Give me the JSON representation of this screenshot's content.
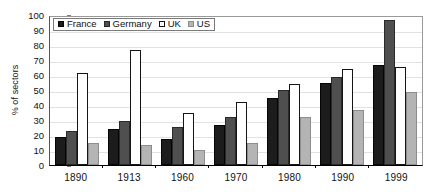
{
  "chart_data": {
    "type": "bar",
    "title": "",
    "subtitle": "",
    "xlabel": "",
    "ylabel": "% of sectors",
    "ylim": [
      0,
      100
    ],
    "ytick_step": 10,
    "yticks": [
      100,
      90,
      80,
      70,
      60,
      50,
      40,
      30,
      20,
      10,
      0
    ],
    "grid": true,
    "legend_position": "top-left",
    "categories": [
      "1890",
      "1913",
      "1960",
      "1970",
      "1980",
      "1990",
      "1999"
    ],
    "series": [
      {
        "name": "France",
        "color": "#1c1c1c",
        "values": [
          18.5,
          24,
          17.5,
          27,
          45,
          55,
          66.5
        ]
      },
      {
        "name": "Germany",
        "color": "#4f4f4f",
        "values": [
          23,
          29.5,
          25.5,
          32,
          50,
          59,
          96.5
        ]
      },
      {
        "name": "UK",
        "color": "#ffffff",
        "values": [
          61.5,
          77,
          34.5,
          42,
          54,
          64,
          65.5
        ]
      },
      {
        "name": "US",
        "color": "#b4b4b4",
        "values": [
          14.5,
          13.5,
          10,
          15,
          32,
          37,
          49
        ]
      }
    ]
  }
}
